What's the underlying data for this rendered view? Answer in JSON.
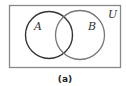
{
  "diagram": {
    "type": "venn",
    "universe": {
      "label": "U"
    },
    "sets": [
      {
        "label": "A",
        "stroke": "#333333"
      },
      {
        "label": "B",
        "stroke": "#777777"
      }
    ],
    "caption": "(a)",
    "colors": {
      "background": "#ffffff",
      "frame": "#888888",
      "set_a": "#333333",
      "set_b": "#777777"
    }
  }
}
